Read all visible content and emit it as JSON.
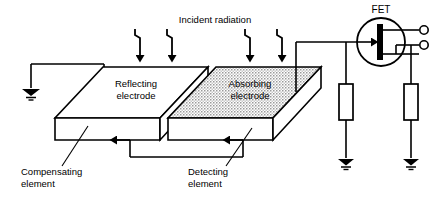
{
  "figure": {
    "type": "technical-line-diagram",
    "background_color": "#ffffff",
    "line_color": "#000000"
  },
  "labels": {
    "incident_radiation": "Incident radiation",
    "reflecting_electrode_line1": "Reflecting",
    "reflecting_electrode_line2": "electrode",
    "absorbing_electrode_line1": "Absorbing",
    "absorbing_electrode_line2": "electrode",
    "compensating_element_line1": "Compensating",
    "compensating_element_line2": "element",
    "detecting_element_line1": "Detecting",
    "detecting_element_line2": "element",
    "fet": "FET"
  },
  "components": {
    "fet_symbol": "field-effect-transistor",
    "ground_symbols": 3,
    "resistors": 2,
    "output_terminals": 2,
    "radiation_arrows": 4,
    "polarization_arrows": 2,
    "slabs": [
      {
        "name": "compensating-element",
        "surface": "reflecting-electrode",
        "fill": "#ffffff"
      },
      {
        "name": "detecting-element",
        "surface": "absorbing-electrode",
        "fill": "stippled-gray"
      }
    ]
  },
  "colors": {
    "stroke": "#000000",
    "slab_face": "#ffffff",
    "absorbing_fill": "#c8c8c8",
    "text": "#000000"
  }
}
